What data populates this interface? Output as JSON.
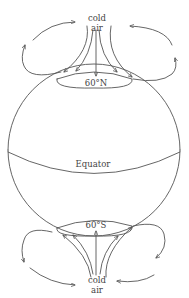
{
  "diagram": {
    "type": "atmospheric-circulation-globe",
    "labels": {
      "north_cold": "cold",
      "north_air": "air",
      "north_lat": "60°N",
      "equator": "Equator",
      "south_lat": "60°S",
      "south_cold": "cold",
      "south_air": "air"
    },
    "colors": {
      "line": "#555555",
      "text": "#444444",
      "background": "#ffffff"
    }
  }
}
